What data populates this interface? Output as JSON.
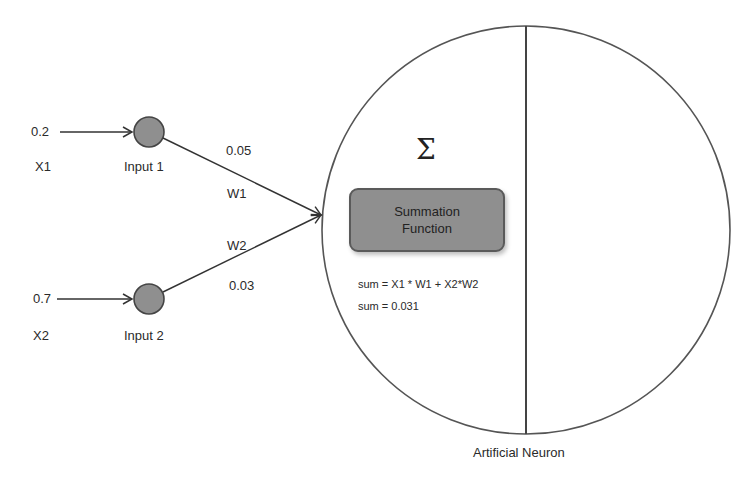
{
  "inputs": [
    {
      "value": "0.2",
      "var": "X1",
      "node_label": "Input 1"
    },
    {
      "value": "0.7",
      "var": "X2",
      "node_label": "Input 2"
    }
  ],
  "weights": [
    {
      "value": "0.05",
      "name": "W1"
    },
    {
      "value": "0.03",
      "name": "W2"
    }
  ],
  "neuron": {
    "symbol": "Σ",
    "box_line1": "Summation",
    "box_line2": "Function",
    "formula": "sum = X1 * W1 + X2*W2",
    "result": "sum = 0.031",
    "caption": "Artificial Neuron"
  },
  "colors": {
    "node_fill": "#8f8f8f",
    "stroke": "#333333",
    "box_fill": "#8f8f8f"
  }
}
